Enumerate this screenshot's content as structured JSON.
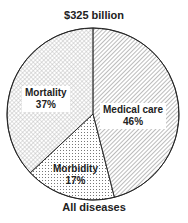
{
  "chart_data": {
    "type": "pie",
    "title": "$325 billion",
    "caption": "All diseases",
    "slices": [
      {
        "label": "Medical care",
        "value": 46,
        "display": "46%",
        "pattern": "diagonal-hatch"
      },
      {
        "label": "Morbidity",
        "value": 17,
        "display": "17%",
        "pattern": "dots"
      },
      {
        "label": "Mortality",
        "value": 37,
        "display": "37%",
        "pattern": "crosshatch"
      }
    ],
    "start_angle_deg": 0,
    "direction": "clockwise",
    "legend": "none"
  }
}
